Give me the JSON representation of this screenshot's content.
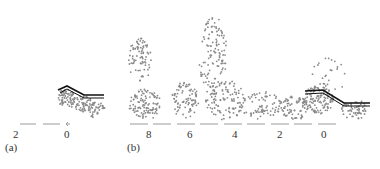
{
  "panel_a": {
    "label": "(a)",
    "ticks": [
      {
        "value": "2",
        "x": 16
      },
      {
        "value": "0",
        "x": 67
      }
    ]
  },
  "panel_b": {
    "label": "(b)",
    "ticks": [
      {
        "value": "8",
        "x": 149
      },
      {
        "value": "6",
        "x": 190
      },
      {
        "value": "4",
        "x": 235
      },
      {
        "value": "2",
        "x": 280
      },
      {
        "value": "0",
        "x": 324
      }
    ]
  },
  "colors": {
    "particles": "#888888",
    "wall": "#111111",
    "axis": "#9a9a9a",
    "text": "#333333"
  }
}
